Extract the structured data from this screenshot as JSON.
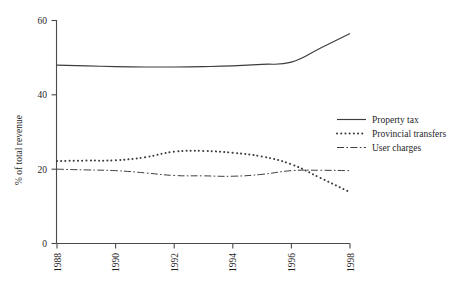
{
  "chart_data": {
    "type": "line",
    "title": "",
    "subtitle": "",
    "xlabel": "",
    "ylabel": "% of total revenue",
    "xlim": [
      1988,
      1998
    ],
    "ylim": [
      0,
      60
    ],
    "grid": false,
    "legend_position": "right-middle",
    "x": [
      1988,
      1989,
      1990,
      1991,
      1992,
      1993,
      1994,
      1995,
      1996,
      1997,
      1998
    ],
    "xticks": [
      "1988",
      "1990",
      "1992",
      "1994",
      "1996",
      "1998"
    ],
    "xtick_values": [
      1988,
      1990,
      1992,
      1994,
      1996,
      1998
    ],
    "yticks": [
      "0",
      "20",
      "40",
      "60"
    ],
    "ytick_values": [
      0,
      20,
      40,
      60
    ],
    "series": [
      {
        "name": "Property tax",
        "style": "solid",
        "color": "#3d3d3d",
        "values": [
          48.0,
          47.8,
          47.6,
          47.5,
          47.5,
          47.6,
          47.8,
          48.2,
          48.8,
          52.6,
          56.5
        ]
      },
      {
        "name": "Provincial transfers",
        "style": "dotted",
        "color": "#3d3d3d",
        "values": [
          22.2,
          22.3,
          22.4,
          23.2,
          24.7,
          24.9,
          24.4,
          23.4,
          21.3,
          17.6,
          13.8
        ]
      },
      {
        "name": "User charges",
        "style": "dash-dot",
        "color": "#3d3d3d",
        "values": [
          20.0,
          19.8,
          19.6,
          19.0,
          18.3,
          18.2,
          18.1,
          18.6,
          19.6,
          19.7,
          19.6
        ]
      }
    ]
  },
  "axes": {
    "y_axis_label": "% of total revenue",
    "y_tick_labels": [
      "60",
      "40",
      "20",
      "0"
    ],
    "x_tick_labels": [
      "1988",
      "1990",
      "1992",
      "1994",
      "1996",
      "1998"
    ]
  },
  "legend": {
    "entries": [
      {
        "label": "Property tax",
        "style": "solid"
      },
      {
        "label": "Provincial transfers",
        "style": "dotted"
      },
      {
        "label": "User charges",
        "style": "dash-dot"
      }
    ]
  },
  "colors": {
    "background": "#ffffff",
    "ink": "#3d3d3d",
    "text": "#1f1f1f"
  }
}
